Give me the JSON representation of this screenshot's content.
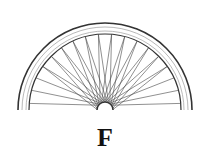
{
  "figure": {
    "label": "F",
    "colors": {
      "stroke": "#333333",
      "background": "#ffffff"
    }
  }
}
